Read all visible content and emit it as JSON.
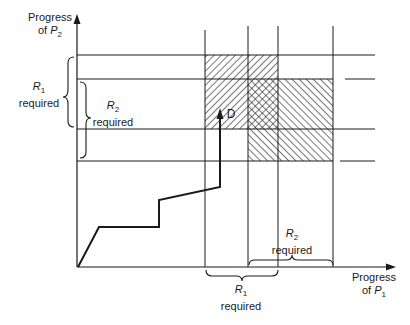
{
  "diagram": {
    "type": "deadlock-progress-diagram",
    "y_axis": {
      "line1": "Progress",
      "line2_prefix": "of ",
      "var": "P",
      "sub": "2"
    },
    "x_axis": {
      "line1": "Progress",
      "line2_prefix": "of ",
      "var": "P",
      "sub": "1"
    },
    "left_brace_outer": {
      "var": "R",
      "sub": "1",
      "text": "required"
    },
    "left_brace_inner": {
      "var": "R",
      "sub": "2",
      "text": "required"
    },
    "bottom_brace_left": {
      "var": "R",
      "sub": "1",
      "text": "required"
    },
    "bottom_brace_right": {
      "var": "R",
      "sub": "2",
      "text": "required"
    },
    "point_label": "D",
    "colors": {
      "ink": "#1a1a1a",
      "background": "#ffffff"
    }
  }
}
